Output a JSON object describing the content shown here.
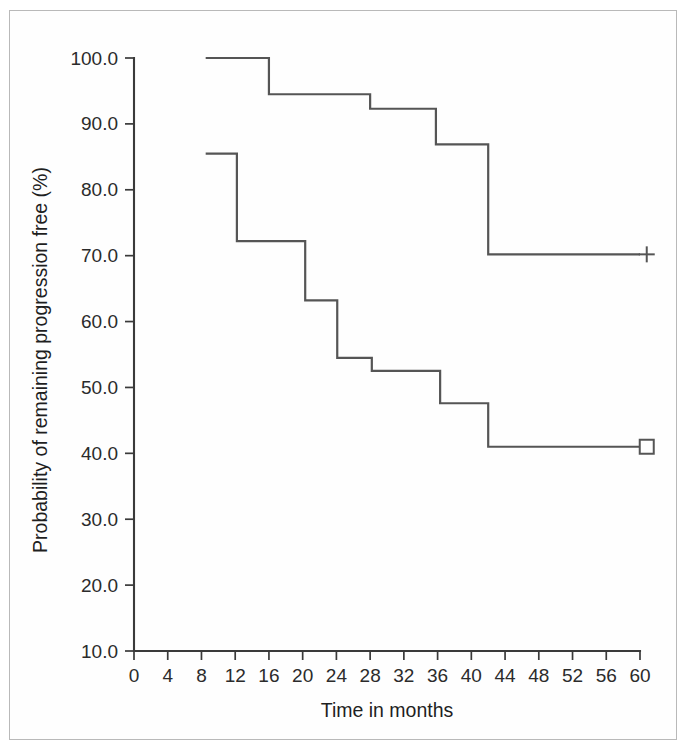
{
  "chart_data": {
    "type": "line",
    "title": "",
    "subtitle": "",
    "xlabel": "Time in months",
    "ylabel": "Probability of remaining progression free (%)",
    "xlim": [
      0,
      60
    ],
    "ylim": [
      10.0,
      100.0
    ],
    "grid": false,
    "legend_position": "right-inline-markers",
    "x_ticks": [
      0,
      4,
      8,
      12,
      16,
      20,
      24,
      28,
      32,
      36,
      40,
      44,
      48,
      52,
      56,
      60
    ],
    "x_tick_labels": [
      "0",
      "4",
      "8",
      "12",
      "16",
      "20",
      "24",
      "28",
      "32",
      "36",
      "40",
      "44",
      "48",
      "52",
      "56",
      "60"
    ],
    "y_ticks": [
      10.0,
      20.0,
      30.0,
      40.0,
      50.0,
      60.0,
      70.0,
      80.0,
      90.0,
      100.0
    ],
    "y_tick_labels": [
      "10.0",
      "20.0",
      "30.0",
      "40.0",
      "50.0",
      "60.0",
      "70.0",
      "80.0",
      "90.0",
      "100.0"
    ],
    "line_color": "#555555",
    "axis_color": "#3a3a3a",
    "series": [
      {
        "name": "upper-curve",
        "marker": "plus",
        "marker_symbol": "+",
        "marker_x": 60.8,
        "marker_y": 70.2,
        "steps": [
          {
            "x": 8.5,
            "y": 100.0
          },
          {
            "x": 16.0,
            "y": 100.0
          },
          {
            "x": 16.0,
            "y": 94.5
          },
          {
            "x": 28.0,
            "y": 94.5
          },
          {
            "x": 28.0,
            "y": 92.3
          },
          {
            "x": 35.8,
            "y": 92.3
          },
          {
            "x": 35.8,
            "y": 86.9
          },
          {
            "x": 42.0,
            "y": 86.9
          },
          {
            "x": 42.0,
            "y": 70.2
          },
          {
            "x": 60.0,
            "y": 70.2
          }
        ]
      },
      {
        "name": "lower-curve",
        "marker": "square",
        "marker_symbol": "□",
        "marker_x": 60.8,
        "marker_y": 41.0,
        "steps": [
          {
            "x": 8.5,
            "y": 85.5
          },
          {
            "x": 12.2,
            "y": 85.5
          },
          {
            "x": 12.2,
            "y": 72.2
          },
          {
            "x": 20.3,
            "y": 72.2
          },
          {
            "x": 20.3,
            "y": 63.2
          },
          {
            "x": 24.1,
            "y": 63.2
          },
          {
            "x": 24.1,
            "y": 54.5
          },
          {
            "x": 28.2,
            "y": 54.5
          },
          {
            "x": 28.2,
            "y": 52.5
          },
          {
            "x": 36.3,
            "y": 52.5
          },
          {
            "x": 36.3,
            "y": 47.6
          },
          {
            "x": 42.0,
            "y": 47.6
          },
          {
            "x": 42.0,
            "y": 41.0
          },
          {
            "x": 60.0,
            "y": 41.0
          }
        ]
      }
    ]
  }
}
